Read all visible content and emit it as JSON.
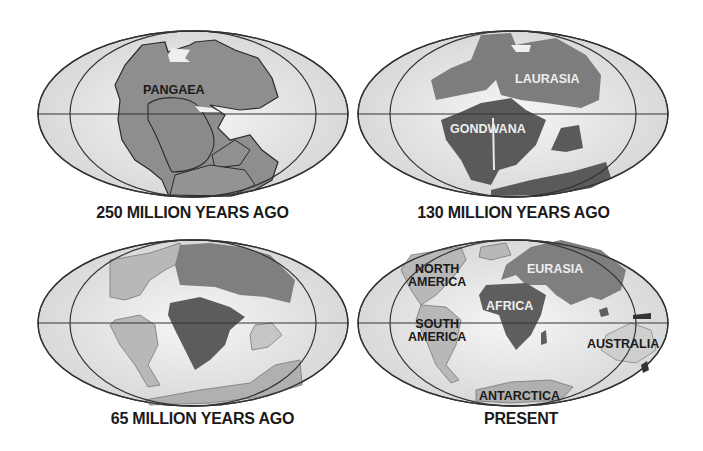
{
  "colors": {
    "ocean": "#e6e6e6",
    "ocean_center": "#f4f4f4",
    "outline": "#333333",
    "pangaea": "#8a8a8a",
    "laurasia": "#7d7d7d",
    "gondwana": "#5c5c5c",
    "light_land": "#b8b8b8",
    "eurasia": "#7f7f7f",
    "africa": "#5e5e5e"
  },
  "panels": [
    {
      "id": "p250",
      "caption": "250 MILLION YEARS AGO",
      "labels": [
        {
          "text": "PANGAEA"
        }
      ]
    },
    {
      "id": "p130",
      "caption": "130 MILLION YEARS AGO",
      "labels": [
        {
          "text": "LAURASIA"
        },
        {
          "text": "GONDWANA"
        }
      ]
    },
    {
      "id": "p65",
      "caption": "65 MILLION YEARS AGO",
      "labels": []
    },
    {
      "id": "present",
      "caption": "PRESENT",
      "labels": [
        {
          "text": "NORTH\nAMERICA"
        },
        {
          "text": "SOUTH\nAMERICA"
        },
        {
          "text": "EURASIA"
        },
        {
          "text": "AFRICA"
        },
        {
          "text": "AUSTRALIA"
        },
        {
          "text": "ANTARCTICA"
        }
      ]
    }
  ]
}
